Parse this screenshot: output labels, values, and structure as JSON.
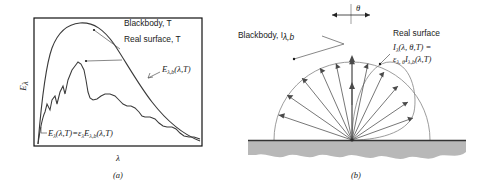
{
  "figure": {
    "panel_a": {
      "caption": "(a)",
      "y_axis_label": "E",
      "y_axis_sub": "λ",
      "x_axis_label": "λ",
      "labels": {
        "blackbody": "Blackbody, T",
        "real_surface": "Real surface, T",
        "blackbody_curve": "E",
        "blackbody_curve_sub": "λ,b",
        "blackbody_curve_args": "(λ,T)",
        "equation_lhs": "E",
        "equation_lhs_sub": "λ",
        "equation_lhs_args": "(λ,T)",
        "equation_eq": "=",
        "equation_eps": "ε",
        "equation_eps_sub": "λ",
        "equation_rhs": "E",
        "equation_rhs_sub": "λ,b",
        "equation_rhs_args": "(λ,T)"
      }
    },
    "panel_b": {
      "caption": "(b)",
      "angle_symbol": "θ",
      "labels": {
        "blackbody": "Blackbody, I",
        "blackbody_sub": "λ,b",
        "real_surface": "Real surface",
        "real_line1_main": "I",
        "real_line1_sub": "λ",
        "real_line1_args": "(λ, θ,T) =",
        "real_line2_eps": "ε",
        "real_line2_eps_sub": "λ, θ",
        "real_line2_main": "I",
        "real_line2_sub": "λ,b",
        "real_line2_args": "(λ,T)"
      }
    }
  },
  "colors": {
    "curve": "#3a3a3a",
    "lobe": "#8a8a8a",
    "ground": "#b8b8b8",
    "text": "#1a1a1a"
  }
}
